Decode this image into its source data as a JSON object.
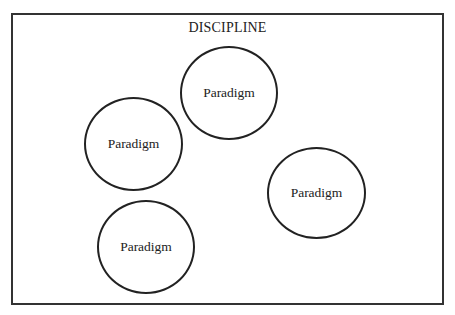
{
  "diagram": {
    "container_label": "DISCIPLINE",
    "nodes": [
      {
        "id": "top",
        "label": "Paradigm"
      },
      {
        "id": "left",
        "label": "Paradigm"
      },
      {
        "id": "right",
        "label": "Paradigm"
      },
      {
        "id": "bottom",
        "label": "Paradigm"
      }
    ],
    "colors": {
      "stroke": "#222222",
      "background": "#ffffff"
    }
  }
}
